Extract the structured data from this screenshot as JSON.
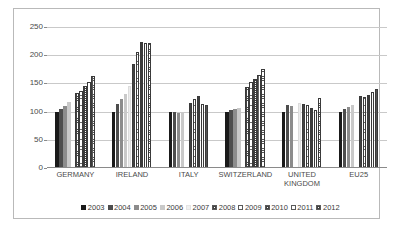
{
  "chart_data": {
    "type": "bar",
    "title": "",
    "subtitle": "",
    "xlabel": "",
    "ylabel": "",
    "ylim": [
      0,
      250
    ],
    "yticks": [
      0,
      50,
      100,
      150,
      200,
      250
    ],
    "grid": true,
    "legend_position": "bottom",
    "categories": [
      "GERMANY",
      "IRELAND",
      "ITALY",
      "SWITZERLAND",
      "UNITED KINGDOM",
      "EU25"
    ],
    "series": [
      {
        "name": "2003",
        "color": "#1a1a1a",
        "values": [
          100,
          100,
          100,
          100,
          100,
          100
        ]
      },
      {
        "name": "2004",
        "color": "#4d4d4d",
        "values": [
          105,
          114,
          99,
          102,
          111,
          105
        ]
      },
      {
        "name": "2005",
        "color": "#8c8c8c",
        "values": [
          110,
          122,
          98,
          104,
          110,
          109
        ]
      },
      {
        "name": "2006",
        "color": "#c9c9c9",
        "values": [
          117,
          131,
          99,
          107,
          0,
          111
        ]
      },
      {
        "name": "2007",
        "color": "#ececec",
        "values": [
          0,
          145,
          0,
          0,
          115,
          0
        ]
      },
      {
        "name": "2008",
        "color": "#ffffff",
        "values": [
          133,
          185,
          115,
          143,
          113,
          127
        ]
      },
      {
        "name": "2009",
        "color": "#ffffff",
        "values": [
          136,
          206,
          122,
          153,
          111,
          126
        ]
      },
      {
        "name": "2010",
        "color": "#ffffff",
        "values": [
          145,
          224,
          127,
          158,
          106,
          130
        ]
      },
      {
        "name": "2011",
        "color": "#ffffff",
        "values": [
          153,
          221,
          113,
          165,
          102,
          135
        ]
      },
      {
        "name": "2012",
        "color": "#ffffff",
        "values": [
          163,
          221,
          112,
          176,
          125,
          140
        ]
      }
    ]
  },
  "legend": {
    "items": [
      "2003",
      "2004",
      "2005",
      "2006",
      "2007",
      "2008",
      "2009",
      "2010",
      "2011",
      "2012"
    ]
  },
  "axis": {
    "y_tick_labels": [
      "250",
      "200",
      "150",
      "100",
      "50",
      "0"
    ]
  }
}
